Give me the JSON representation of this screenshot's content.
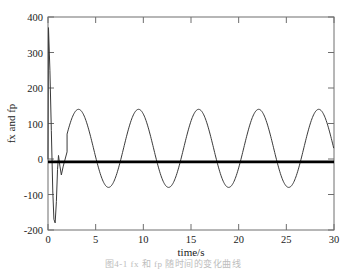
{
  "figure": {
    "caption": "图4-1 fx 和 fp 随时间的变化曲线"
  },
  "axes": {
    "xlabel": "time/s",
    "ylabel": "fx and fp",
    "x_ticks": [
      "0",
      "5",
      "10",
      "15",
      "20",
      "25",
      "30"
    ],
    "y_ticks": [
      "400",
      "300",
      "200",
      "100",
      "0",
      "-100",
      "-200"
    ]
  },
  "colors": {
    "fx_line": "#3a3a3a",
    "fp_line": "#000000",
    "axis": "#6e6e6e",
    "text": "#1a1a1a",
    "background": "#ffffff"
  },
  "chart_data": {
    "type": "line",
    "title": "",
    "xlabel": "time/s",
    "ylabel": "fx and fp",
    "xlim": [
      0,
      30
    ],
    "ylim": [
      -200,
      400
    ],
    "x_ticks": [
      0,
      5,
      10,
      15,
      20,
      25,
      30
    ],
    "y_ticks": [
      -200,
      -100,
      0,
      100,
      200,
      300,
      400
    ],
    "grid": false,
    "legend": "none",
    "series": [
      {
        "name": "fx",
        "description": "Oscillating response with large startup transient then steady sinusoid",
        "style": "thin-solid",
        "transient": {
          "peak_value": 370,
          "peak_time": 0.05,
          "min_value": -180,
          "min_time": 0.75
        },
        "steady_state": {
          "amplitude": 110,
          "offset": 30,
          "period": 6.3,
          "peak_value": 140,
          "trough_value": -80,
          "peak_times": [
            3.2,
            9.5,
            15.8,
            22.1,
            28.4
          ],
          "trough_times": [
            6.3,
            12.6,
            18.9,
            25.2
          ]
        },
        "x": [
          0,
          0.05,
          0.2,
          0.35,
          0.5,
          0.62,
          0.75,
          0.88,
          1.0,
          1.1,
          1.25,
          1.4,
          1.6,
          2.0,
          2.5,
          3.2,
          4.0,
          5.0,
          6.3,
          7.5,
          8.5,
          9.5,
          10.5,
          11.5,
          12.6,
          13.8,
          15.0,
          15.8,
          16.8,
          17.8,
          18.9,
          20.0,
          21.2,
          22.1,
          23.2,
          24.2,
          25.2,
          26.4,
          27.5,
          28.4,
          29.4,
          30
        ],
        "y": [
          0,
          370,
          250,
          80,
          -90,
          -170,
          -180,
          -120,
          -30,
          10,
          -20,
          -45,
          -20,
          20,
          75,
          140,
          120,
          35,
          -80,
          -10,
          75,
          140,
          120,
          35,
          -80,
          -10,
          110,
          140,
          120,
          35,
          -80,
          -10,
          110,
          140,
          120,
          35,
          -80,
          -10,
          110,
          138,
          80,
          10
        ]
      },
      {
        "name": "fp",
        "description": "Constant value, drawn as a thick horizontal line near zero",
        "style": "thick-solid",
        "constant_value": -8,
        "x": [
          0,
          30
        ],
        "y": [
          -8,
          -8
        ]
      }
    ]
  }
}
